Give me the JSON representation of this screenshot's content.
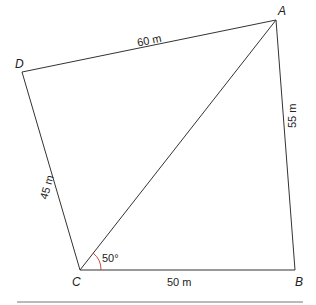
{
  "diagram": {
    "vertices": {
      "A": {
        "label": "A",
        "x": 276,
        "y": 20
      },
      "B": {
        "label": "B",
        "x": 295,
        "y": 270
      },
      "C": {
        "label": "C",
        "x": 80,
        "y": 270
      },
      "D": {
        "label": "D",
        "x": 22,
        "y": 72
      }
    },
    "edges": {
      "DA": "60 m",
      "AB": "55 m",
      "CD": "45 m",
      "CB": "50 m"
    },
    "diagonal": "CA",
    "angle": {
      "vertex": "C",
      "label": "50°",
      "color": "#c0392b"
    },
    "line_color": "#333333"
  }
}
